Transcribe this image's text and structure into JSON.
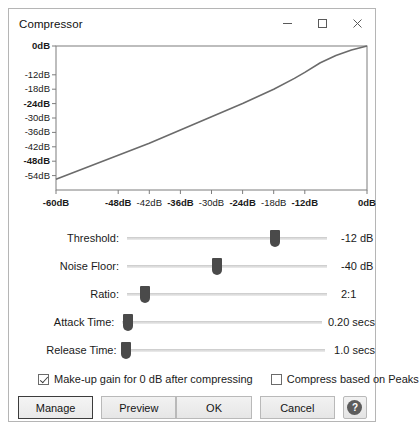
{
  "window": {
    "title": "Compressor",
    "caption": {
      "minimize": "minimize-icon",
      "maximize": "maximize-icon",
      "close": "close-icon"
    }
  },
  "chart_data": {
    "type": "line",
    "title": "",
    "xlabel": "",
    "ylabel": "",
    "xlim": [
      -60,
      0
    ],
    "ylim": [
      -60,
      0
    ],
    "grid": false,
    "legend": null,
    "y_ticks": [
      {
        "label": "0dB",
        "value": 0,
        "bold": true
      },
      {
        "label": "-12dB",
        "value": -12,
        "bold": false
      },
      {
        "label": "-18dB",
        "value": -18,
        "bold": false
      },
      {
        "label": "-24dB",
        "value": -24,
        "bold": true
      },
      {
        "label": "-30dB",
        "value": -30,
        "bold": false
      },
      {
        "label": "-36dB",
        "value": -36,
        "bold": false
      },
      {
        "label": "-42dB",
        "value": -42,
        "bold": false
      },
      {
        "label": "-48dB",
        "value": -48,
        "bold": true
      },
      {
        "label": "-54dB",
        "value": -54,
        "bold": false
      }
    ],
    "x_ticks": [
      {
        "label": "-60dB",
        "value": -60,
        "bold": true
      },
      {
        "label": "-48dB",
        "value": -48,
        "bold": true
      },
      {
        "label": "-42dB",
        "value": -42,
        "bold": false
      },
      {
        "label": "-36dB",
        "value": -36,
        "bold": true
      },
      {
        "label": "-30dB",
        "value": -30,
        "bold": false
      },
      {
        "label": "-24dB",
        "value": -24,
        "bold": true
      },
      {
        "label": "-18dB",
        "value": -18,
        "bold": false
      },
      {
        "label": "-12dB",
        "value": -12,
        "bold": true
      },
      {
        "label": "0dB",
        "value": 0,
        "bold": true
      }
    ],
    "series": [
      {
        "name": "compression-curve",
        "color": "#6b6b6b",
        "points": [
          [
            -60,
            -55.5
          ],
          [
            -54,
            -50.5
          ],
          [
            -48,
            -45.5
          ],
          [
            -42,
            -40.5
          ],
          [
            -36,
            -35.0
          ],
          [
            -30,
            -29.5
          ],
          [
            -24,
            -24.0
          ],
          [
            -18,
            -18.0
          ],
          [
            -14,
            -13.5
          ],
          [
            -12,
            -11.0
          ],
          [
            -9,
            -7.0
          ],
          [
            -6,
            -4.0
          ],
          [
            -3,
            -1.7
          ],
          [
            0,
            0
          ]
        ]
      }
    ]
  },
  "sliders": [
    {
      "label": "Threshold:",
      "value": "-12 dB",
      "position": 74
    },
    {
      "label": "Noise Floor:",
      "value": "-40 dB",
      "position": 45
    },
    {
      "label": "Ratio:",
      "value": "2:1",
      "position": 9
    },
    {
      "label": "Attack Time:",
      "value": "0.20 secs",
      "position": 3
    },
    {
      "label": "Release Time:",
      "value": "1.0 secs",
      "position": 1
    }
  ],
  "checkboxes": [
    {
      "label": "Make-up gain for 0 dB after compressing",
      "checked": true
    },
    {
      "label": "Compress based on Peaks",
      "checked": false
    }
  ],
  "buttons": {
    "manage": "Manage",
    "preview": "Preview",
    "ok": "OK",
    "cancel": "Cancel",
    "help": "?"
  },
  "colors": {
    "curve": "#6b6b6b",
    "thumb": "#4a4a4a",
    "border": "#b5b5b5"
  }
}
